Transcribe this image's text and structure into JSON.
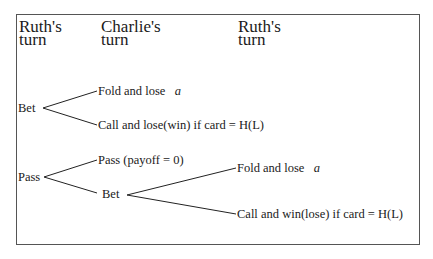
{
  "headers": {
    "col1": {
      "line1": "Ruth's",
      "line2": "turn"
    },
    "col2": {
      "line1": "Charlie's",
      "line2": "turn"
    },
    "col3": {
      "line1": "Ruth's",
      "line2": "turn"
    }
  },
  "tree": {
    "bet": {
      "label": "Bet",
      "fold": {
        "label": "Fold and lose",
        "var": "a"
      },
      "call": {
        "label": "Call and lose(win) if card = H(L)"
      }
    },
    "pass": {
      "label": "Pass",
      "pass": {
        "label": "Pass (payoff = 0)"
      },
      "bet": {
        "label": "Bet",
        "fold": {
          "label": "Fold and lose",
          "var": "a"
        },
        "call": {
          "label": "Call and win(lose) if card = H(L)"
        }
      }
    }
  }
}
